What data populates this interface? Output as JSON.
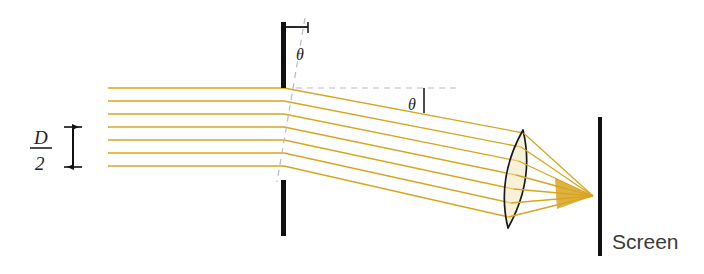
{
  "figure": {
    "background_color": "#ffffff"
  },
  "colors": {
    "ray": "#d8a520",
    "ray_light": "#e8c766",
    "barrier": "#111111",
    "screen": "#111111",
    "lens_outline": "#1a1a1a",
    "lens_fill": "#f2e3b8",
    "dashed_normal": "#b9b9c8",
    "dashed_axis": "#b9bed0",
    "text": "#222222",
    "arrow_head": "#111111",
    "focus_cone": "#d8a520"
  },
  "labels": {
    "aperture_angle": "θ",
    "diffraction_angle": "θ",
    "slit_width_numerator": "D",
    "slit_width_denominator": "2",
    "screen": "Screen"
  },
  "geometry": {
    "aperture_plane_x": 283,
    "upper_barrier": {
      "x": 283,
      "y_top": 22,
      "y_bottom": 88,
      "width": 5
    },
    "lower_barrier": {
      "x": 283,
      "y_top": 180,
      "y_bottom": 236,
      "width": 5
    },
    "screen_bar": {
      "x": 600,
      "y_top": 117,
      "y_bottom": 256,
      "width": 4
    },
    "normal_dashed_line": {
      "x1": 305,
      "y1": 18,
      "x2": 277,
      "y2": 182
    },
    "horizontal_dashed_axis": {
      "x1": 296,
      "y1": 88,
      "x2": 456,
      "y2": 88
    },
    "lens": {
      "top_x": 523,
      "top_y": 130,
      "bottom_x": 508,
      "bottom_y": 228,
      "bulge": 13
    },
    "focal_point": {
      "x": 593,
      "y": 196
    },
    "incoming_rays_y": [
      88,
      101,
      114,
      127,
      140,
      153,
      166
    ],
    "incoming_ray_start_x": 108,
    "slit_width_arrow": {
      "x": 73,
      "y_top": 127,
      "y_bottom": 167
    },
    "slit_width_label_position": {
      "x": 40,
      "y": 147
    },
    "aperture_angle_label_position": {
      "x": 296,
      "y": 54
    },
    "diffraction_angle_label_position": {
      "x": 413,
      "y": 106
    },
    "screen_label_position": {
      "x": 612,
      "y": 243
    }
  },
  "description": {
    "incoming_beam": "Seven parallel horizontal light rays travelling left to right",
    "aperture": "Narrow slit of width D between two opaque barriers, tilted normal",
    "diffracted_beam": "Rays deflected downward by angle theta after the slit",
    "lens_action": "Biconvex converging lens focuses the parallel diffracted rays to a point",
    "screen_action": "Focal point falls just in front of the observation screen"
  }
}
